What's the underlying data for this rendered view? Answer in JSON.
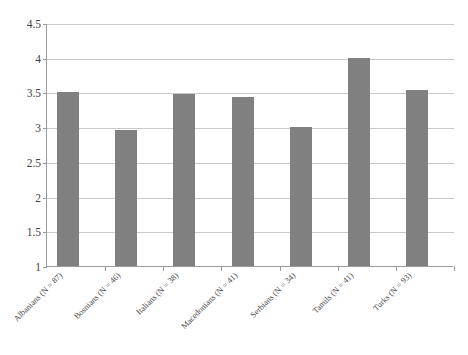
{
  "chart_data": {
    "type": "bar",
    "title": "",
    "subtitle": "",
    "xlabel": "",
    "ylabel": "",
    "categories": [
      "Albanians (N = 87)",
      "Bosnians (N = 46)",
      "Italians (N = 38)",
      "Macedonians (N = 41)",
      "Serbians (N = 34)",
      "Tamils (N = 41)",
      "Turks (N = 93)"
    ],
    "values": [
      3.5,
      2.96,
      3.48,
      3.43,
      3.0,
      4.0,
      3.53
    ],
    "ylim": [
      1,
      4.5
    ],
    "yticks": [
      "1",
      "1.5",
      "2",
      "2.5",
      "3",
      "3.5",
      "4",
      "4.5"
    ],
    "ytick_values": [
      1,
      1.5,
      2,
      2.5,
      3,
      3.5,
      4,
      4.5
    ],
    "grid": true,
    "legend": null,
    "legend_position": "none",
    "annotations": [],
    "series": [
      {
        "name": "",
        "values": [
          3.5,
          2.96,
          3.48,
          3.43,
          3.0,
          4.0,
          3.53
        ]
      }
    ],
    "colors": {
      "bar": "#808080",
      "gridline": "#c9c9c9",
      "axis": "#9a9a9a",
      "text": "#3f3f3f",
      "background": "#ffffff"
    }
  }
}
